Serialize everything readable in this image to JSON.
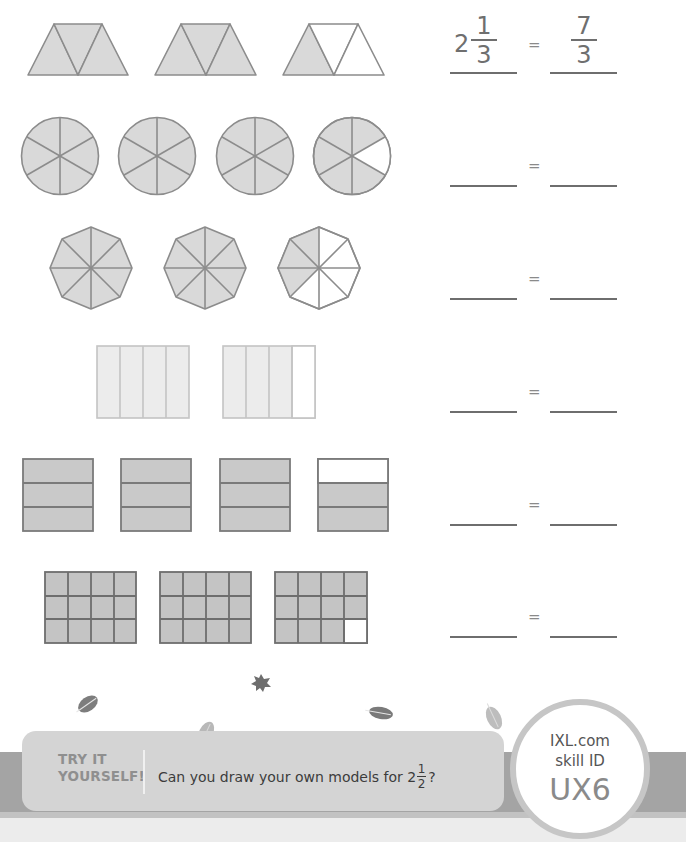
{
  "worksheet": {
    "fill_color": "#d9d9d9",
    "stroke_color": "#8c8c8c",
    "empty_color": "#ffffff",
    "rows": [
      {
        "model": "trapezoid-triangles",
        "parts_per_whole": 3,
        "wholes_shown": 3,
        "shaded": [
          3,
          3,
          1
        ],
        "equation": {
          "left_whole": "2",
          "left_num": "1",
          "left_den": "3",
          "equals": "=",
          "right_num": "7",
          "right_den": "3"
        }
      },
      {
        "model": "circle-sixths",
        "parts_per_whole": 6,
        "wholes_shown": 4,
        "shaded": [
          6,
          6,
          6,
          5
        ],
        "equation": {
          "equals": "="
        }
      },
      {
        "model": "octagon-eighths",
        "parts_per_whole": 8,
        "wholes_shown": 3,
        "shaded": [
          8,
          8,
          3
        ],
        "equation": {
          "equals": "="
        }
      },
      {
        "model": "rectangle-vertical-fourths",
        "parts_per_whole": 4,
        "wholes_shown": 2,
        "shaded": [
          4,
          3
        ],
        "equation": {
          "equals": "="
        }
      },
      {
        "model": "rectangle-horizontal-thirds",
        "parts_per_whole": 3,
        "wholes_shown": 4,
        "shaded": [
          3,
          3,
          3,
          2
        ],
        "equation": {
          "equals": "="
        }
      },
      {
        "model": "grid-twelfths",
        "parts_per_whole": 12,
        "wholes_shown": 3,
        "shaded": [
          12,
          12,
          11
        ],
        "equation": {
          "equals": "="
        }
      }
    ]
  },
  "decorations": {
    "leaf_icons": [
      "leaf-icon",
      "maple-leaf-icon",
      "leaf-icon",
      "leaf-icon",
      "leaf-icon"
    ]
  },
  "footer": {
    "try_label_line1": "TRY IT",
    "try_label_line2": "YOURSELF!",
    "prompt_text": "Can you draw your own models for 2",
    "prompt_frac_num": "1",
    "prompt_frac_den": "2",
    "prompt_end": "?",
    "badge": {
      "line1": "IXL.com",
      "line2": "skill ID",
      "code": "UX6"
    }
  }
}
